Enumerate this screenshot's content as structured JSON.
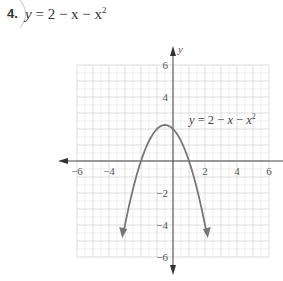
{
  "problem": {
    "number": "4.",
    "equation_lhs": "y",
    "equation_rhs": "= 2 − x − x",
    "equation_exp": "2"
  },
  "chart_data": {
    "type": "line",
    "xlabel": "",
    "ylabel": "y",
    "xlim": [
      -6,
      6
    ],
    "ylim": [
      -6,
      6
    ],
    "grid": true,
    "x_ticks": [
      "−6",
      "−4",
      "2",
      "4",
      "6"
    ],
    "y_ticks": [
      "6",
      "4",
      "−2",
      "−4",
      "−6"
    ],
    "series": [
      {
        "name": "y = 2 − x − x²",
        "x": [
          -3.1,
          -3,
          -2.5,
          -2,
          -1.5,
          -1,
          -0.5,
          0,
          0.5,
          1,
          1.5,
          2,
          2.5,
          2.6
        ],
        "y": [
          -5.51,
          -4,
          -1.75,
          0,
          1.25,
          2,
          2.25,
          2,
          1.25,
          0,
          -1.75,
          -4,
          -6.75,
          -7.36
        ]
      }
    ],
    "annotations": [
      {
        "text": "y = 2 − x − x²",
        "x": 0.9,
        "y": 2.4
      }
    ],
    "legend": "none"
  }
}
